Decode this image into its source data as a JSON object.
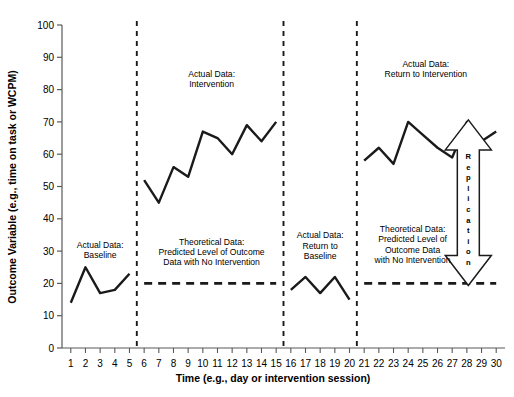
{
  "chart_data": {
    "type": "line",
    "title": "",
    "xlabel": "Time (e.g., day or intervention session)",
    "ylabel": "Outcome Variable (e.g., time on task or WCPM)",
    "xlim": [
      0.4,
      30.6
    ],
    "ylim": [
      0,
      100
    ],
    "ytick_values": [
      0,
      10,
      20,
      30,
      40,
      50,
      60,
      70,
      80,
      90,
      100
    ],
    "ytick_labels": [
      "0",
      "10",
      "20",
      "30",
      "40",
      "50",
      "60",
      "70",
      "80",
      "90",
      "100"
    ],
    "xtick_values": [
      1,
      2,
      3,
      4,
      5,
      6,
      7,
      8,
      9,
      10,
      11,
      12,
      13,
      14,
      15,
      16,
      17,
      18,
      19,
      20,
      21,
      22,
      23,
      24,
      25,
      26,
      27,
      28,
      29,
      30
    ],
    "xtick_labels": [
      "1",
      "2",
      "3",
      "4",
      "5",
      "6",
      "7",
      "8",
      "9",
      "10",
      "11",
      "12",
      "13",
      "14",
      "15",
      "16",
      "17",
      "18",
      "19",
      "20",
      "21",
      "22",
      "23",
      "24",
      "25",
      "26",
      "27",
      "28",
      "29",
      "30"
    ],
    "grid": false,
    "legend": "none",
    "series": [
      {
        "name": "Actual Data: Baseline",
        "style": "solid",
        "x": [
          1,
          2,
          3,
          4,
          5
        ],
        "values": [
          14,
          25,
          17,
          18,
          23
        ]
      },
      {
        "name": "Actual Data: Intervention",
        "style": "solid",
        "x": [
          6,
          7,
          8,
          9,
          10,
          11,
          12,
          13,
          14,
          15
        ],
        "values": [
          52,
          45,
          56,
          53,
          67,
          65,
          60,
          69,
          64,
          70
        ]
      },
      {
        "name": "Theoretical Data: Predicted Level of Outcome Data with No Intervention (phase B)",
        "style": "dashed",
        "x": [
          6,
          15
        ],
        "values": [
          20,
          20
        ]
      },
      {
        "name": "Actual Data: Return to Baseline",
        "style": "solid",
        "x": [
          16,
          17,
          18,
          19,
          20
        ],
        "values": [
          18,
          22,
          17,
          22,
          15
        ]
      },
      {
        "name": "Actual Data: Return to Intervention",
        "style": "solid",
        "x": [
          21,
          22,
          23,
          24,
          25,
          26,
          27,
          28,
          29,
          30
        ],
        "values": [
          58,
          62,
          57,
          70,
          66,
          62,
          59,
          70,
          64,
          67
        ]
      },
      {
        "name": "Theoretical Data: Predicted Level of Outcome Data with No Intervention (phase B2)",
        "style": "dashed",
        "x": [
          21,
          30
        ],
        "values": [
          20,
          20
        ]
      }
    ],
    "phase_lines": [
      {
        "name": "phase-line-baseline-to-intervention",
        "x": 5.5,
        "style": "dashed"
      },
      {
        "name": "phase-line-intervention-to-return-baseline",
        "x": 15.5,
        "style": "dashed"
      },
      {
        "name": "phase-line-return-baseline-to-return-intervention",
        "x": 20.5,
        "style": "dashed"
      }
    ],
    "annotations": [
      {
        "name": "annotation-baseline",
        "lines": [
          "Actual Data:",
          "Baseline"
        ],
        "x": 3.0,
        "y": 31
      },
      {
        "name": "annotation-intervention",
        "lines": [
          "Actual Data:",
          "Intervention"
        ],
        "x": 10.6,
        "y": 84
      },
      {
        "name": "annotation-theoretical-b1",
        "lines": [
          "Theoretical Data:",
          "Predicted Level of Outcome",
          "Data with No Intervention"
        ],
        "x": 10.6,
        "y": 32
      },
      {
        "name": "annotation-return-to-baseline",
        "lines": [
          "Actual Data:",
          "Return to",
          "Baseline"
        ],
        "x": 18.0,
        "y": 34
      },
      {
        "name": "annotation-return-to-intervention",
        "lines": [
          "Actual Data:",
          "Return to Intervention"
        ],
        "x": 25.2,
        "y": 87
      },
      {
        "name": "annotation-theoretical-b2",
        "lines": [
          "Theoretical Data:",
          "Predicted Level of",
          "Outcome Data",
          "with No Intervention"
        ],
        "x": 24.3,
        "y": 36
      },
      {
        "name": "annotation-replication-arrow",
        "text": "Replication",
        "letters": [
          "R",
          "e",
          "p",
          "l",
          "i",
          "c",
          "a",
          "t",
          "i",
          "o",
          "n"
        ],
        "x": 28.1,
        "y_top": 70,
        "y_bottom": 20
      }
    ],
    "colors": {
      "line": "#1a1a1a",
      "axis": "#595959",
      "text": "#000000",
      "background": "#ffffff"
    }
  }
}
